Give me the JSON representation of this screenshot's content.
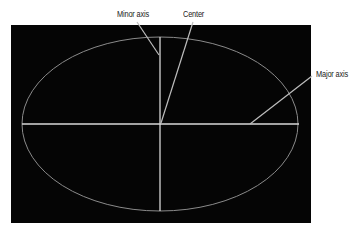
{
  "diagram": {
    "labels": {
      "minor_axis": "Minor axis",
      "center": "Center",
      "major_axis": "Major axis"
    },
    "colors": {
      "background": "#ffffff",
      "panel": "#050505",
      "ellipse_stroke": "#8a8a8a",
      "axis_stroke": "#d8d8d8",
      "leader_stroke": "#bdbdbd",
      "text": "#222222"
    },
    "geometry": {
      "panel": {
        "x": 11,
        "y": 25,
        "width": 300,
        "height": 198
      },
      "ellipse": {
        "cx": 160,
        "cy": 124,
        "rx": 138,
        "ry": 87
      },
      "center": {
        "x": 160,
        "y": 124
      }
    }
  }
}
